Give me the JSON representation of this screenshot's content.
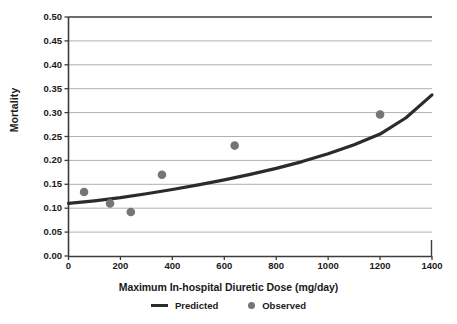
{
  "chart_data": {
    "type": "scatter",
    "title": "",
    "xlabel": "Maximum In-hospital Diuretic Dose (mg/day)",
    "ylabel": "Mortality",
    "xlim": [
      0,
      1400
    ],
    "ylim": [
      0.0,
      0.5
    ],
    "xticks": [
      0,
      200,
      400,
      600,
      800,
      1000,
      1200,
      1400
    ],
    "xtick_labels": [
      "0",
      "200",
      "400",
      "600",
      "800",
      "1000",
      "1200",
      "1400"
    ],
    "yticks": [
      0.0,
      0.05,
      0.1,
      0.15,
      0.2,
      0.25,
      0.3,
      0.35,
      0.4,
      0.45,
      0.5
    ],
    "ytick_labels": [
      "0.00",
      "0.05",
      "0.10",
      "0.15",
      "0.20",
      "0.25",
      "0.30",
      "0.35",
      "0.40",
      "0.45",
      "0.50"
    ],
    "grid": "horizontal",
    "legend_position": "below-axis",
    "series": [
      {
        "name": "Predicted",
        "type": "line",
        "color": "#2b2b2b",
        "x": [
          0,
          100,
          200,
          300,
          400,
          500,
          600,
          700,
          800,
          900,
          1000,
          1100,
          1200,
          1300,
          1400
        ],
        "values": [
          0.11,
          0.1155,
          0.1222,
          0.1302,
          0.1392,
          0.1489,
          0.1594,
          0.1708,
          0.1833,
          0.1975,
          0.2138,
          0.2327,
          0.2551,
          0.2892,
          0.337
        ]
      },
      {
        "name": "Observed",
        "type": "scatter",
        "color": "#757575",
        "x": [
          60,
          160,
          240,
          360,
          640,
          1200
        ],
        "values": [
          0.134,
          0.11,
          0.092,
          0.17,
          0.231,
          0.296
        ]
      }
    ]
  },
  "legend": {
    "predicted_label": "Predicted",
    "observed_label": "Observed"
  },
  "colors": {
    "line": "#2b2b2b",
    "marker": "#757575",
    "grid": "#b0b0b0",
    "axis": "#3c3c3c",
    "background": "#ffffff"
  }
}
